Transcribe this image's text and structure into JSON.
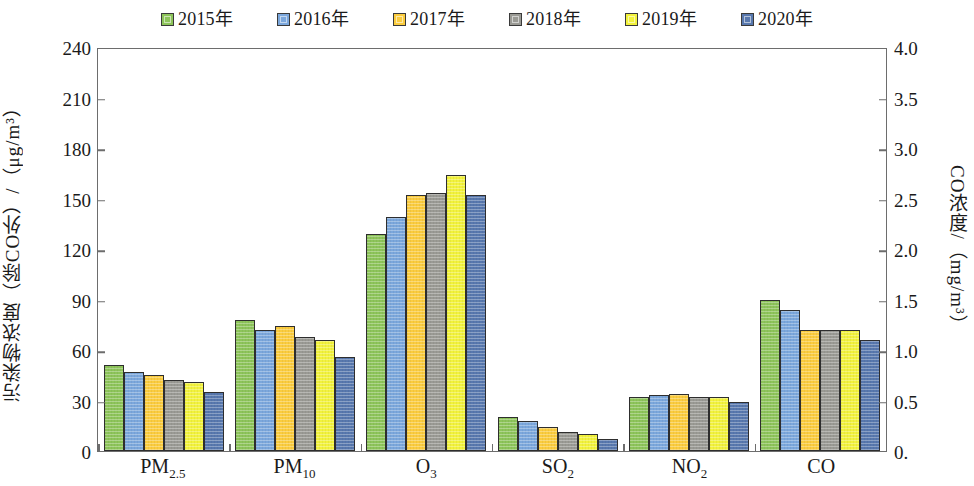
{
  "legend": {
    "position": "top-center",
    "items": [
      {
        "label": "2015年",
        "color": "#8DC45A"
      },
      {
        "label": "2016年",
        "color": "#7BA7DC"
      },
      {
        "label": "2017年",
        "color": "#FBCC3E"
      },
      {
        "label": "2018年",
        "color": "#9A9A94"
      },
      {
        "label": "2019年",
        "color": "#F2F23C"
      },
      {
        "label": "2020年",
        "color": "#5878AE"
      }
    ]
  },
  "axes": {
    "left": {
      "title": "污染物浓度（除CO外）/（μg/m³）",
      "min": 0,
      "max": 240,
      "step": 30,
      "ticks": [
        "0",
        "30",
        "60",
        "90",
        "120",
        "150",
        "180",
        "210",
        "240"
      ]
    },
    "right": {
      "title": "CO浓度/（mg/m³）",
      "min": 0,
      "max": 4.0,
      "step": 0.5,
      "ticks": [
        "0.",
        "0.5",
        "1.0",
        "1.5",
        "2.0",
        "2.5",
        "3.0",
        "3.5",
        "4.0"
      ]
    },
    "x": {
      "categories": [
        "PM2.5",
        "PM10",
        "O3",
        "SO2",
        "NO2",
        "CO"
      ],
      "labels_html": [
        "PM<sub>2.5</sub>",
        "PM<sub>10</sub>",
        "O<sub>3</sub>",
        "SO<sub>2</sub>",
        "NO<sub>2</sub>",
        "CO"
      ]
    }
  },
  "chart_data": {
    "type": "bar",
    "title": "",
    "xlabel": "",
    "ylabel": "污染物浓度（除CO外）/（μg/m³）",
    "y2label": "CO浓度/（mg/m³）",
    "ylim": [
      0,
      240
    ],
    "y2lim": [
      0,
      4.0
    ],
    "grid": false,
    "legend_position": "top-center",
    "categories": [
      "PM2.5",
      "PM10",
      "O3",
      "SO2",
      "NO2",
      "CO"
    ],
    "units": [
      "μg/m³",
      "μg/m³",
      "μg/m³",
      "μg/m³",
      "μg/m³",
      "mg/m³"
    ],
    "co_uses_secondary_axis": true,
    "series": [
      {
        "name": "2015年",
        "color": "#8DC45A",
        "values": [
          51,
          78,
          129,
          20,
          32,
          1.5
        ]
      },
      {
        "name": "2016年",
        "color": "#7BA7DC",
        "values": [
          47,
          72,
          139,
          18,
          33,
          1.4
        ]
      },
      {
        "name": "2017年",
        "color": "#FBCC3E",
        "values": [
          45,
          74,
          152,
          14,
          34,
          1.2
        ]
      },
      {
        "name": "2018年",
        "color": "#9A9A94",
        "values": [
          42,
          68,
          153,
          11,
          32,
          1.2
        ]
      },
      {
        "name": "2019年",
        "color": "#F2F23C",
        "values": [
          41,
          66,
          164,
          10,
          32,
          1.2
        ]
      },
      {
        "name": "2020年",
        "color": "#5878AE",
        "values": [
          35,
          56,
          152,
          7,
          29,
          1.1
        ]
      }
    ]
  }
}
